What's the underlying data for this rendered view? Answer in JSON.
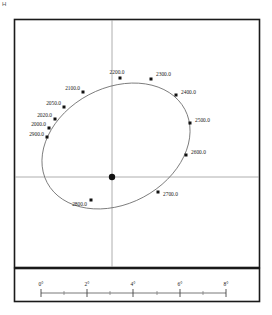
{
  "figure": {
    "corner_mark": "H",
    "frame": {
      "outer_border_color": "#1a1a1a",
      "axis_color": "#9a9a9a",
      "orbit_color": "#6d6d6d",
      "marker_color": "#111111"
    }
  },
  "chart_data": {
    "type": "scatter",
    "title": "",
    "xlabel": "",
    "ylabel": "",
    "grid": false,
    "legend": null,
    "center_marker": {
      "name": "primary-star",
      "x_px": 112,
      "y_px": 177
    },
    "axes_lines": {
      "vertical_x_px": 112,
      "horizontal_y_px": 177
    },
    "orbit_ellipse": {
      "center_x_px": 116,
      "center_y_px": 146,
      "semi_major_px": 78,
      "semi_minor_px": 58,
      "rotation_deg": -28
    },
    "epochs": [
      {
        "label": "2000.0",
        "marker_x_px": 49,
        "marker_y_px": 128,
        "text_x_px": 46,
        "text_y_px": 126,
        "anchor": "end"
      },
      {
        "label": "2020.0",
        "marker_x_px": 55,
        "marker_y_px": 119,
        "text_x_px": 52,
        "text_y_px": 117,
        "anchor": "end"
      },
      {
        "label": "2050.0",
        "marker_x_px": 64,
        "marker_y_px": 107,
        "text_x_px": 61,
        "text_y_px": 105,
        "anchor": "end"
      },
      {
        "label": "2100.0",
        "marker_x_px": 83,
        "marker_y_px": 92,
        "text_x_px": 80,
        "text_y_px": 90,
        "anchor": "end"
      },
      {
        "label": "2200.0",
        "marker_x_px": 120,
        "marker_y_px": 78,
        "text_x_px": 117,
        "text_y_px": 74,
        "anchor": "middle"
      },
      {
        "label": "2300.0",
        "marker_x_px": 151,
        "marker_y_px": 79,
        "text_x_px": 156,
        "text_y_px": 76,
        "anchor": "start"
      },
      {
        "label": "2400.0",
        "marker_x_px": 176,
        "marker_y_px": 95,
        "text_x_px": 181,
        "text_y_px": 94,
        "anchor": "start"
      },
      {
        "label": "2500.0",
        "marker_x_px": 190,
        "marker_y_px": 123,
        "text_x_px": 195,
        "text_y_px": 122,
        "anchor": "start"
      },
      {
        "label": "2600.0",
        "marker_x_px": 186,
        "marker_y_px": 155,
        "text_x_px": 191,
        "text_y_px": 154,
        "anchor": "start"
      },
      {
        "label": "2700.0",
        "marker_x_px": 158,
        "marker_y_px": 192,
        "text_x_px": 163,
        "text_y_px": 196,
        "anchor": "start"
      },
      {
        "label": "2800.0",
        "marker_x_px": 91,
        "marker_y_px": 200,
        "text_x_px": 87,
        "text_y_px": 206,
        "anchor": "end"
      },
      {
        "label": "2900.0",
        "marker_x_px": 47,
        "marker_y_px": 137,
        "text_x_px": 44,
        "text_y_px": 136,
        "anchor": "end"
      }
    ]
  },
  "scale_bar": {
    "unit": "arcsec",
    "axis_start_px": 41,
    "axis_end_px": 226,
    "axis_y_px": 293,
    "major_ticks": [
      {
        "label": "0°",
        "x_px": 41
      },
      {
        "label": "2°",
        "x_px": 87
      },
      {
        "label": "4°",
        "x_px": 133
      },
      {
        "label": "6°",
        "x_px": 180
      },
      {
        "label": "8°",
        "x_px": 226
      }
    ],
    "minor_ticks_px": [
      64,
      110,
      157,
      203
    ]
  }
}
